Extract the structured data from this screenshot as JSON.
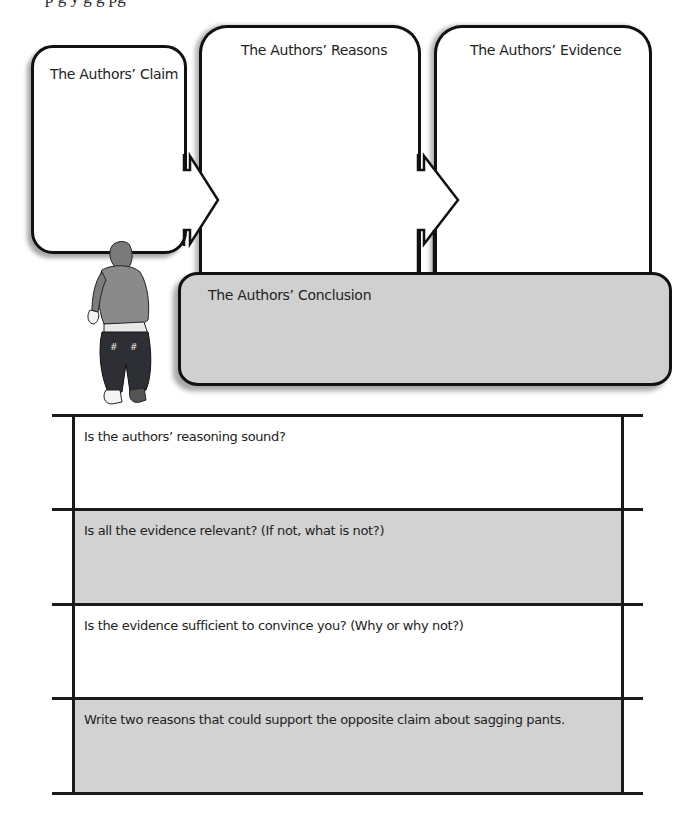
{
  "page": {
    "clipped_header_text": "p                g                         y    g          g                  pg"
  },
  "organizer": {
    "claim": {
      "title": "The Authors’ Claim"
    },
    "reasons": {
      "title": "The Authors’ Reasons"
    },
    "evidence": {
      "title": "The Authors’ Evidence"
    },
    "conclusion": {
      "title": "The Authors’ Conclusion"
    },
    "illustration": "teen-in-sagging-pants-illustration"
  },
  "questions": [
    {
      "prompt": "Is the authors’ reasoning sound?",
      "shaded": false
    },
    {
      "prompt": "Is all the evidence relevant? (If not, what is not?)",
      "shaded": true
    },
    {
      "prompt": "Is the evidence sufficient to convince you? (Why or why not?)",
      "shaded": false
    },
    {
      "prompt": "Write two reasons that could support the opposite claim about sagging pants.",
      "shaded": true
    }
  ],
  "colors": {
    "line": "#111111",
    "shade": "#d2d2d2",
    "paper": "#ffffff"
  }
}
